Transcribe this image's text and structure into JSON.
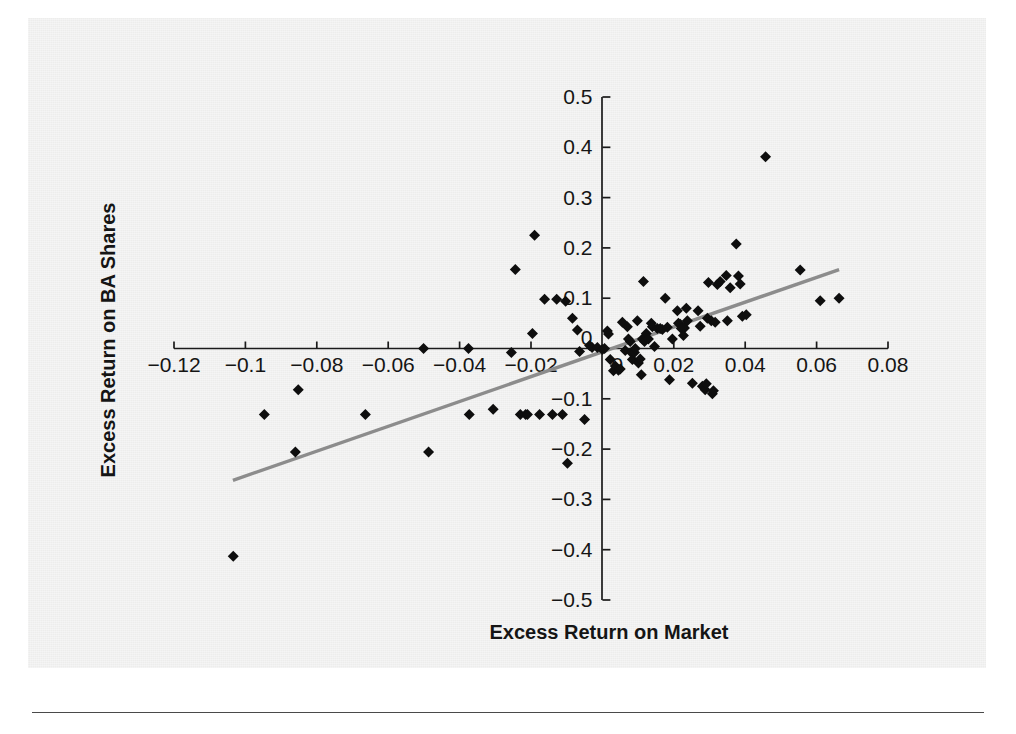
{
  "chart_data": {
    "type": "scatter",
    "title": "",
    "subtitle": "",
    "xlabel": "Excess Return on Market",
    "ylabel": "Excess Return on BA Shares",
    "xlim": [
      -0.13,
      0.09
    ],
    "ylim": [
      -0.5,
      0.5
    ],
    "xticks": [
      -0.12,
      -0.1,
      -0.08,
      -0.06,
      -0.04,
      -0.02,
      0,
      0.02,
      0.04,
      0.06,
      0.08
    ],
    "xticklabels": [
      "-0.12",
      "-0.1",
      "-0.08",
      "-0.06",
      "-0.04",
      "-0.02",
      "0",
      "0.02",
      "0.04",
      "0.06",
      "0.08"
    ],
    "yticks": [
      -0.5,
      -0.4,
      -0.3,
      -0.2,
      -0.1,
      0,
      0.1,
      0.2,
      0.3,
      0.4,
      0.5
    ],
    "yticklabels": [
      "-0.5",
      "-0.4",
      "-0.3",
      "-0.2",
      "-0.1",
      "0",
      "0.1",
      "0.2",
      "0.3",
      "0.4",
      "0.5"
    ],
    "grid": false,
    "legend": null,
    "axes_style": "crossed-at-origin",
    "marker": "diamond",
    "marker_color": "#0e0e0e",
    "marker_size": 11,
    "trendline": {
      "type": "linear",
      "color": "#8c8c8c",
      "width": 3.4,
      "x_start": -0.1035,
      "y_start": -0.262,
      "x_end": 0.0663,
      "y_end": 0.157,
      "slope": 2.468,
      "intercept": -0.0065
    },
    "points": [
      [
        -0.1034,
        -0.413
      ],
      [
        -0.0947,
        -0.131
      ],
      [
        -0.0852,
        -0.082
      ],
      [
        -0.086,
        -0.206
      ],
      [
        -0.0664,
        -0.131
      ],
      [
        -0.0501,
        0.0
      ],
      [
        -0.0487,
        -0.206
      ],
      [
        -0.0375,
        0.0
      ],
      [
        -0.0373,
        -0.131
      ],
      [
        -0.0306,
        -0.121
      ],
      [
        -0.0255,
        -0.008
      ],
      [
        -0.0244,
        0.157
      ],
      [
        -0.023,
        -0.131
      ],
      [
        -0.0215,
        -0.131
      ],
      [
        -0.021,
        -0.131
      ],
      [
        -0.0196,
        0.03
      ],
      [
        -0.019,
        0.225
      ],
      [
        -0.0176,
        -0.131
      ],
      [
        -0.0162,
        0.098
      ],
      [
        -0.014,
        -0.131
      ],
      [
        -0.0128,
        0.098
      ],
      [
        -0.0112,
        -0.131
      ],
      [
        -0.0103,
        0.094
      ],
      [
        -0.0098,
        -0.228
      ],
      [
        -0.0084,
        0.06
      ],
      [
        -0.007,
        0.037
      ],
      [
        -0.0064,
        -0.006
      ],
      [
        -0.005,
        -0.141
      ],
      [
        -0.0036,
        0.006
      ],
      [
        -0.0029,
        0.002
      ],
      [
        -0.0014,
        0.002
      ],
      [
        0.0,
        -0.002
      ],
      [
        0.0006,
        0.0
      ],
      [
        0.0014,
        0.035
      ],
      [
        0.0017,
        0.029
      ],
      [
        0.0022,
        -0.022
      ],
      [
        0.0031,
        -0.044
      ],
      [
        0.0036,
        -0.035
      ],
      [
        0.0045,
        -0.043
      ],
      [
        0.005,
        -0.041
      ],
      [
        0.0056,
        0.052
      ],
      [
        0.0064,
        -0.004
      ],
      [
        0.007,
        0.043
      ],
      [
        0.0073,
        0.019
      ],
      [
        0.0078,
        0.014
      ],
      [
        0.0081,
        -0.008
      ],
      [
        0.0084,
        -0.022
      ],
      [
        0.009,
        -0.008
      ],
      [
        0.0092,
        0.0
      ],
      [
        0.0098,
        0.055
      ],
      [
        0.0101,
        -0.029
      ],
      [
        0.0106,
        -0.021
      ],
      [
        0.0109,
        -0.052
      ],
      [
        0.0112,
        0.019
      ],
      [
        0.0115,
        0.133
      ],
      [
        0.0118,
        0.014
      ],
      [
        0.0123,
        0.03
      ],
      [
        0.0129,
        0.019
      ],
      [
        0.0137,
        0.05
      ],
      [
        0.014,
        0.043
      ],
      [
        0.0146,
        0.004
      ],
      [
        0.0154,
        0.04
      ],
      [
        0.0162,
        0.04
      ],
      [
        0.0168,
        0.038
      ],
      [
        0.0176,
        0.1
      ],
      [
        0.0182,
        0.042
      ],
      [
        0.0188,
        -0.062
      ],
      [
        0.0196,
        0.019
      ],
      [
        0.021,
        0.075
      ],
      [
        0.0213,
        0.05
      ],
      [
        0.0218,
        0.048
      ],
      [
        0.0221,
        0.04
      ],
      [
        0.0227,
        0.026
      ],
      [
        0.023,
        0.041
      ],
      [
        0.0235,
        0.08
      ],
      [
        0.0238,
        0.055
      ],
      [
        0.0252,
        -0.069
      ],
      [
        0.0268,
        0.075
      ],
      [
        0.0274,
        0.044
      ],
      [
        0.028,
        -0.075
      ],
      [
        0.0288,
        -0.082
      ],
      [
        0.0291,
        -0.07
      ],
      [
        0.0294,
        0.06
      ],
      [
        0.0297,
        0.131
      ],
      [
        0.0305,
        0.055
      ],
      [
        0.0308,
        -0.09
      ],
      [
        0.0311,
        -0.084
      ],
      [
        0.0316,
        0.052
      ],
      [
        0.0322,
        0.127
      ],
      [
        0.033,
        0.133
      ],
      [
        0.0347,
        0.145
      ],
      [
        0.035,
        0.055
      ],
      [
        0.0358,
        0.121
      ],
      [
        0.0375,
        0.208
      ],
      [
        0.0381,
        0.144
      ],
      [
        0.0386,
        0.128
      ],
      [
        0.0392,
        0.064
      ],
      [
        0.0403,
        0.067
      ],
      [
        0.0457,
        0.381
      ],
      [
        0.0554,
        0.156
      ],
      [
        0.061,
        0.095
      ],
      [
        0.0663,
        0.1
      ]
    ]
  }
}
